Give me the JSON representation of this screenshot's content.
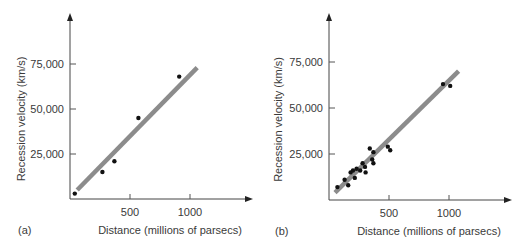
{
  "chart_data": [
    {
      "type": "scatter",
      "panel_label": "(a)",
      "title": "",
      "xlabel": "Distance (millions of parsecs)",
      "ylabel": "Recession velocity (km/s)",
      "xticks": [
        500,
        1000
      ],
      "xtick_labels": [
        "500",
        "1000"
      ],
      "yticks": [
        25000,
        50000,
        75000
      ],
      "ytick_labels": [
        "25,000",
        "50,000",
        "75,000"
      ],
      "xlim": [
        0,
        1400
      ],
      "ylim": [
        0,
        100000
      ],
      "grid": false,
      "points": [
        {
          "x": 40,
          "y": 3000
        },
        {
          "x": 270,
          "y": 15000
        },
        {
          "x": 370,
          "y": 21000
        },
        {
          "x": 570,
          "y": 45000
        },
        {
          "x": 910,
          "y": 68000
        }
      ],
      "fit_line": {
        "x0": 60,
        "y0": 5000,
        "x1": 1060,
        "y1": 73000,
        "color": "#8c8c8c"
      },
      "point_color": "#111111"
    },
    {
      "type": "scatter",
      "panel_label": "(b)",
      "title": "",
      "xlabel": "Distance (millions of parsecs)",
      "ylabel": "Recession velocity (km/s)",
      "xticks": [
        500,
        1000
      ],
      "xtick_labels": [
        "500",
        "1000"
      ],
      "yticks": [
        25000,
        50000,
        75000
      ],
      "ytick_labels": [
        "25,000",
        "50,000",
        "75,000"
      ],
      "xlim": [
        0,
        1400
      ],
      "ylim": [
        0,
        100000
      ],
      "grid": false,
      "points": [
        {
          "x": 70,
          "y": 7000
        },
        {
          "x": 130,
          "y": 11000
        },
        {
          "x": 160,
          "y": 8000
        },
        {
          "x": 180,
          "y": 15000
        },
        {
          "x": 200,
          "y": 16000
        },
        {
          "x": 215,
          "y": 12000
        },
        {
          "x": 230,
          "y": 17000
        },
        {
          "x": 260,
          "y": 16000
        },
        {
          "x": 280,
          "y": 20000
        },
        {
          "x": 300,
          "y": 18000
        },
        {
          "x": 305,
          "y": 15000
        },
        {
          "x": 340,
          "y": 28000
        },
        {
          "x": 360,
          "y": 22000
        },
        {
          "x": 370,
          "y": 20000
        },
        {
          "x": 370,
          "y": 26000
        },
        {
          "x": 490,
          "y": 29000
        },
        {
          "x": 510,
          "y": 27000
        },
        {
          "x": 950,
          "y": 63000
        },
        {
          "x": 1010,
          "y": 62000
        }
      ],
      "fit_line": {
        "x0": 50,
        "y0": 4000,
        "x1": 1080,
        "y1": 70000,
        "color": "#8c8c8c"
      },
      "point_color": "#111111"
    }
  ]
}
